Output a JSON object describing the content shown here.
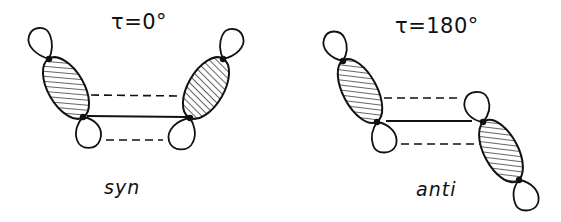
{
  "panels": [
    {
      "id": "syn",
      "title": "τ=0°",
      "caption": "syn",
      "dihedral_angle_deg": 0
    },
    {
      "id": "anti",
      "title": "τ=180°",
      "caption": "anti",
      "dihedral_angle_deg": 180
    }
  ],
  "legend": {
    "solid_line": "sigma bond",
    "dashed_line": "orbital overlap interaction",
    "hatched_lobe": "large orbital lobe (phase)",
    "open_lobe": "small orbital lobe"
  },
  "colors": {
    "stroke": "#111111",
    "background": "#ffffff"
  }
}
